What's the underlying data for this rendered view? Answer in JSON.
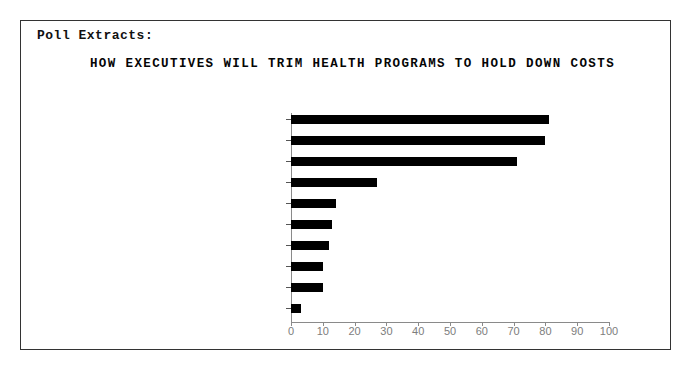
{
  "poster": {
    "section_label": "Poll Extracts:",
    "title": "HOW EXECUTIVES WILL TRIM HEALTH PROGRAMS TO HOLD DOWN COSTS",
    "border_color": "#333333",
    "background_color": "#ffffff"
  },
  "chart_data": {
    "type": "bar",
    "orientation": "horizontal",
    "title": "HOW EXECUTIVES WILL TRIM HEALTH PROGRAMS TO HOLD DOWN COSTS",
    "subtitle": "Poll Extracts:",
    "xlabel": "",
    "ylabel": "",
    "xlim": [
      0,
      100
    ],
    "ylim": [
      0,
      10
    ],
    "grid": false,
    "legend": null,
    "bar_color": "#000000",
    "axis_color": "#8a8a8a",
    "label_color": "#5a5a5a",
    "xticks": [
      0,
      10,
      20,
      30,
      40,
      50,
      60,
      70,
      80,
      90,
      100
    ],
    "xtick_labels": [
      "0",
      "10",
      "20",
      "30",
      "40",
      "50",
      "60",
      "70",
      "80",
      "90",
      "100"
    ],
    "categories": [
      "INCREASE EMPLOYEE PREMIUMS",
      "INCREASE DEDUCTIBLES",
      "INCREASE COPAYMENTS",
      "INSTITUTE CAFETERIA PLAN",
      "CUT EMPLOYEE BENEFITS",
      "CUT DEPENDENT BENEFITS",
      "OFFER MARGINAL PLAN",
      "CUT DENTAL BENEFITS",
      "CUT RETIREE BENEFITS",
      "WOULD NOT TRIM"
    ],
    "values": [
      81,
      80,
      71,
      27,
      14,
      13,
      12,
      10,
      10,
      3
    ],
    "value_suffix": "%",
    "axis_labels": [
      "INCREASE EMPLOYEE PREMIUMS 81%",
      "INCREASE DEDUCTIBLES 80%",
      "INCREASE COPAYMENTS 71%",
      "INSTITUTE CAFETERIA PLAN 27%",
      "CUT EMPLOYEE BENEFITS 14%",
      "CUT DEPENDENT BENEFITS 13%",
      "OFFER MARGINAL PLAN 12%",
      "CUT DENTAL BENEFITS 10%",
      "CUT RETIREE BENEFITS 10%",
      "WOULD NOT TRIM 3%"
    ]
  }
}
